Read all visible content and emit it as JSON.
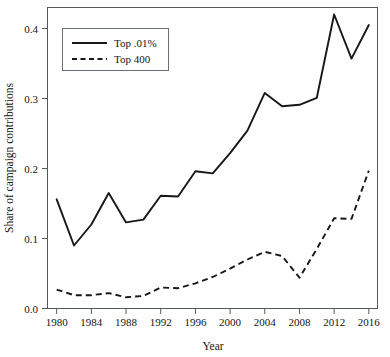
{
  "chart_data": {
    "type": "line",
    "title": "",
    "xlabel": "Year",
    "ylabel": "Share of campaign contributions",
    "xlim": [
      1979,
      2017
    ],
    "ylim": [
      0.0,
      0.43
    ],
    "xticks": [
      1980,
      1984,
      1988,
      1992,
      1996,
      2000,
      2004,
      2008,
      2012,
      2016
    ],
    "xticklabels": [
      "1980",
      "1984",
      "1988",
      "1992",
      "1996",
      "2000",
      "2004",
      "2008",
      "2012",
      "2016"
    ],
    "yticks": [
      0.0,
      0.1,
      0.2,
      0.3,
      0.4
    ],
    "yticklabels": [
      "0.0",
      "0.1",
      "0.2",
      "0.3",
      "0.4"
    ],
    "grid": false,
    "legend_position": "upper left",
    "x": [
      1980,
      1982,
      1984,
      1986,
      1988,
      1990,
      1992,
      1994,
      1996,
      1998,
      2000,
      2002,
      2004,
      2006,
      2008,
      2010,
      2012,
      2014,
      2016
    ],
    "series": [
      {
        "name": "Top .01%",
        "style": "solid",
        "color": "#171717",
        "values": [
          0.156,
          0.09,
          0.12,
          0.165,
          0.123,
          0.127,
          0.161,
          0.16,
          0.196,
          0.193,
          0.222,
          0.254,
          0.308,
          0.289,
          0.291,
          0.301,
          0.42,
          0.357,
          0.405
        ]
      },
      {
        "name": "Top 400",
        "style": "dashed",
        "color": "#171717",
        "values": [
          0.027,
          0.019,
          0.019,
          0.022,
          0.016,
          0.018,
          0.03,
          0.029,
          0.036,
          0.045,
          0.057,
          0.07,
          0.081,
          0.075,
          0.044,
          0.085,
          0.129,
          0.128,
          0.197
        ]
      }
    ]
  },
  "legend": {
    "entries": [
      {
        "label": "Top .01%",
        "style": "solid"
      },
      {
        "label": "Top 400",
        "style": "dashed"
      }
    ]
  },
  "axes": {
    "x_title": "Year",
    "y_title": "Share of campaign contributions"
  }
}
